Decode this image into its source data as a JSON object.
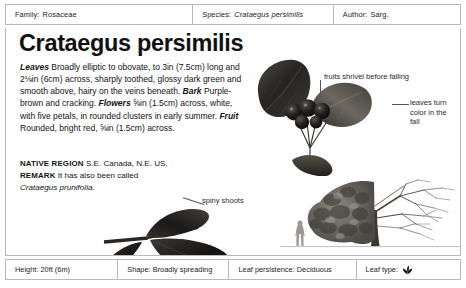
{
  "header": {
    "family_label": "Family:",
    "family_value": "Rosaceae",
    "species_label": "Species:",
    "species_value": "Crataegus persimilis",
    "author_label": "Author:",
    "author_value": "Sarg."
  },
  "main": {
    "title": "Crataegus persimilis",
    "description": {
      "leaves_label": "Leaves",
      "leaves_text": " Broadly elliptic to obovate, to 3in (7.5cm) long and 2⅛in (6cm) across, sharply toothed, glossy dark green and smooth above, hairy on the veins beneath. ",
      "bark_label": "Bark",
      "bark_text": " Purple-brown and cracking. ",
      "flowers_label": "Flowers",
      "flowers_text": " ⅝in (1.5cm) across, white, with five petals, in rounded clusters in early summer. ",
      "fruit_label": "Fruit",
      "fruit_text": " Rounded, bright red, ⅝in (1.5cm) across."
    },
    "native_region_label": "NATIVE REGION",
    "native_region_value": "S.E. Canada, N.E. US.",
    "remark_label": "REMARK",
    "remark_text_before": "It has also been called ",
    "remark_italic": "Crataegus prunifolia",
    "remark_text_after": "."
  },
  "annotations": {
    "fruits": "fruits shrivel before falling",
    "leaves_fall": "leaves turn color in the fall",
    "spiny": "spiny shoots"
  },
  "illustrations": {
    "branch": "fruiting-branch-with-berries",
    "low_leaf": "spiny-shoot-with-leaves",
    "tree": "mature-tree-half-foliage",
    "human": "human-scale-silhouette"
  },
  "footer": {
    "height": "Height: 20ft (6m)",
    "shape": "Shape: Broadly spreading",
    "persistence": "Leaf persistence: Deciduous",
    "leaf_type_label": "Leaf type:",
    "leaf_type_icon": "leaf-icon"
  },
  "colors": {
    "border": "#b9b9b9",
    "text": "#141414",
    "annotation": "#2a2a2a",
    "background": "#ffffff"
  }
}
